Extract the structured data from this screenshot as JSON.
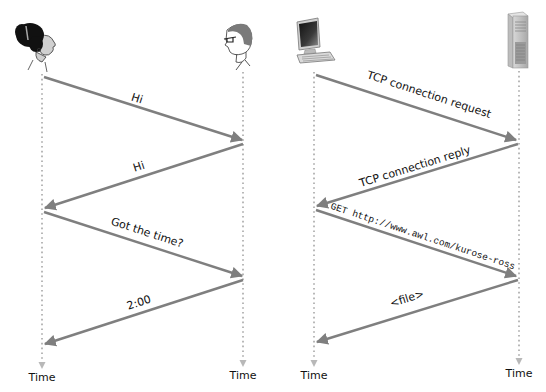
{
  "colors": {
    "arrow": "#7f7f7f",
    "timeline": "#b8b8b8",
    "text": "#111111",
    "background": "#ffffff"
  },
  "left_diagram": {
    "title": "Human protocol",
    "participants": [
      {
        "id": "woman",
        "icon": "woman-head-icon",
        "x": 42
      },
      {
        "id": "man",
        "icon": "man-with-glasses-icon",
        "x": 243
      }
    ],
    "messages": [
      {
        "label": "Hi",
        "from": "woman",
        "to": "man"
      },
      {
        "label": "Hi",
        "from": "man",
        "to": "woman"
      },
      {
        "label": "Got the time?",
        "from": "woman",
        "to": "man"
      },
      {
        "label": "2:00",
        "from": "man",
        "to": "woman"
      }
    ],
    "time_labels": [
      "Time",
      "Time"
    ]
  },
  "right_diagram": {
    "title": "Computer network protocol",
    "participants": [
      {
        "id": "client",
        "icon": "desktop-computer-icon",
        "x": 314
      },
      {
        "id": "server",
        "icon": "server-tower-icon",
        "x": 519
      }
    ],
    "messages": [
      {
        "label": "TCP connection request",
        "from": "client",
        "to": "server"
      },
      {
        "label": "TCP connection reply",
        "from": "server",
        "to": "client"
      },
      {
        "label": "GET http://www.awl.com/kurose-ross",
        "from": "client",
        "to": "server",
        "monospace": true
      },
      {
        "label": "<file>",
        "from": "server",
        "to": "client"
      }
    ],
    "time_labels": [
      "Time",
      "Time"
    ]
  }
}
